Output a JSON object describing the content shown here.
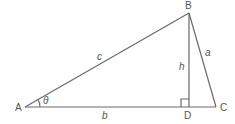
{
  "diagram": {
    "type": "triangle-with-altitude",
    "colors": {
      "line": "#6a6a6a",
      "text": "#555555",
      "background": "#ffffff"
    },
    "vertices": {
      "A": {
        "label": "A",
        "x": 25,
        "y": 107
      },
      "B": {
        "label": "B",
        "x": 189,
        "y": 13
      },
      "C": {
        "label": "C",
        "x": 216,
        "y": 107
      },
      "D": {
        "label": "D",
        "x": 189,
        "y": 107
      }
    },
    "sides": {
      "a": {
        "label": "a",
        "between": [
          "B",
          "C"
        ]
      },
      "b": {
        "label": "b",
        "between": [
          "A",
          "C"
        ]
      },
      "c": {
        "label": "c",
        "between": [
          "A",
          "B"
        ]
      },
      "h": {
        "label": "h",
        "between": [
          "B",
          "D"
        ],
        "role": "altitude"
      }
    },
    "angle": {
      "label": "θ",
      "at": "A"
    },
    "right_angle_marker": {
      "at": "D"
    }
  }
}
